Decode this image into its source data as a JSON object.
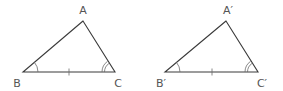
{
  "diagram": {
    "type": "congruent-triangles-ASA",
    "triangles": [
      {
        "name": "ABC",
        "vertices": {
          "A": {
            "label": "A",
            "x": 83,
            "y": 21
          },
          "B": {
            "label": "B",
            "x": 23,
            "y": 72
          },
          "C": {
            "label": "C",
            "x": 115,
            "y": 72
          }
        },
        "marks": {
          "side_BC": "single-tick",
          "angle_B": "single-arc",
          "angle_C": "double-arc"
        }
      },
      {
        "name": "A'B'C'",
        "vertices": {
          "A": {
            "label": "A′",
            "x": 226,
            "y": 21
          },
          "B": {
            "label": "B′",
            "x": 165,
            "y": 72
          },
          "C": {
            "label": "C′",
            "x": 258,
            "y": 72
          }
        },
        "marks": {
          "side_BC": "single-tick",
          "angle_B": "single-arc",
          "angle_C": "double-arc"
        }
      }
    ],
    "colors": {
      "line": "#3a3a3a",
      "label": "#555555",
      "background": "#ffffff"
    }
  }
}
